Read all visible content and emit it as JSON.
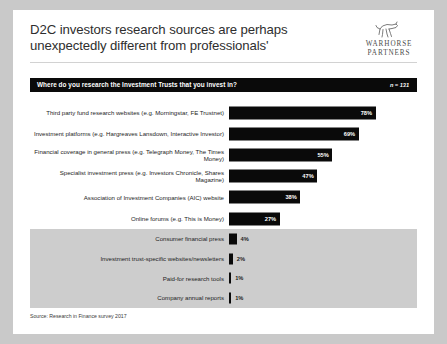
{
  "slide": {
    "title": "D2C investors research sources are perhaps unexpectedly different from professionals'",
    "source_note": "Source: Research in Finance survey 2017"
  },
  "logo": {
    "name": "warhorse-partners-logo",
    "line1": "WARHORSE",
    "line2": "PARTNERS"
  },
  "question_bar": {
    "question": "Where do you research the Investment Trusts  that you invest in?",
    "sample_size": "n = 131",
    "background_color": "#0a0a0a",
    "text_color": "#ffffff"
  },
  "chart_data": {
    "type": "bar",
    "orientation": "horizontal",
    "title": "Where do you research the Investment Trusts  that you invest in?",
    "xlabel": "",
    "ylabel": "",
    "xlim": [
      0,
      100
    ],
    "grid": false,
    "legend": false,
    "sample_size": 131,
    "value_suffix": "%",
    "bar_color": "#0a0a0a",
    "shaded_band_color": "#cdcdcd",
    "categories": [
      "Third party fund research websites (e.g. Morningstar, FE Trustnet)",
      "Investment platforms (e.g. Hargreaves Lansdown, Interactive Investor)",
      "Financial coverage in general press (e.g. Telegraph Money, The Times Money)",
      "Specialist investment press (e.g. Investors Chronicle, Shares Magazine)",
      "Association of Investment Companies (AIC) website",
      "Online forums (e.g. This is Money)",
      "Consumer financial press",
      "Investment trust-specific websites/newsletters",
      "Paid-for research tools",
      "Company annual reports"
    ],
    "values": [
      78,
      69,
      55,
      47,
      38,
      27,
      4,
      2,
      1,
      1
    ],
    "value_labels": [
      "78%",
      "69%",
      "55%",
      "47%",
      "38%",
      "27%",
      "4%",
      "2%",
      "1%",
      "1%"
    ],
    "label_placement": [
      "inside",
      "inside",
      "inside",
      "inside",
      "inside",
      "inside",
      "outside",
      "outside",
      "outside",
      "outside"
    ],
    "shaded_rows": [
      6,
      7,
      8,
      9
    ]
  }
}
